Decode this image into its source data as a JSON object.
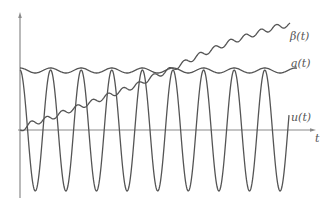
{
  "chart_data": {
    "type": "line",
    "title": "",
    "xlabel": "t",
    "ylabel": "",
    "grid": false,
    "legend": "inline labels at right end of curves",
    "axes": {
      "origin_px": [
        20,
        130
      ],
      "x_axis_end_px": 315,
      "y_axis_top_px": 14,
      "y_axis_bottom_px": 198
    },
    "series": [
      {
        "name": "u(t)",
        "label": "u(t)",
        "description": "oscillation between a(t) envelope and negative trough",
        "peak_y_px": 70,
        "trough_y_px": 191,
        "period_px": 30.6,
        "start_x_px": 20,
        "end_x_px": 289,
        "end_y_px": 120,
        "peaks_x_px": [
          20,
          50.6,
          81,
          112,
          142,
          173,
          204,
          235,
          266
        ]
      },
      {
        "name": "a(t)",
        "label": "a(t)",
        "description": "nearly constant envelope with small ripple",
        "level_y_px": 70,
        "ripple_amp_px": 2.5,
        "period_px": 30.6,
        "start_x_px": 20,
        "end_x_px": 297
      },
      {
        "name": "β(t)",
        "label": "β(t)",
        "description": "increasing ramp with small step ripple",
        "points_px": [
          [
            20,
            130
          ],
          [
            30,
            124
          ],
          [
            50,
            118
          ],
          [
            70,
            110
          ],
          [
            90,
            103
          ],
          [
            110,
            95
          ],
          [
            140,
            84
          ],
          [
            150,
            78
          ],
          [
            170,
            70
          ],
          [
            200,
            55
          ],
          [
            230,
            42
          ],
          [
            260,
            32
          ],
          [
            280,
            26
          ],
          [
            290,
            25
          ]
        ],
        "ripple_amp_px": 2.5,
        "period_px": 15.3
      }
    ]
  },
  "labels": {
    "beta": "β(t)",
    "a": "a(t)",
    "u": "u(t)",
    "t_axis": "t"
  }
}
